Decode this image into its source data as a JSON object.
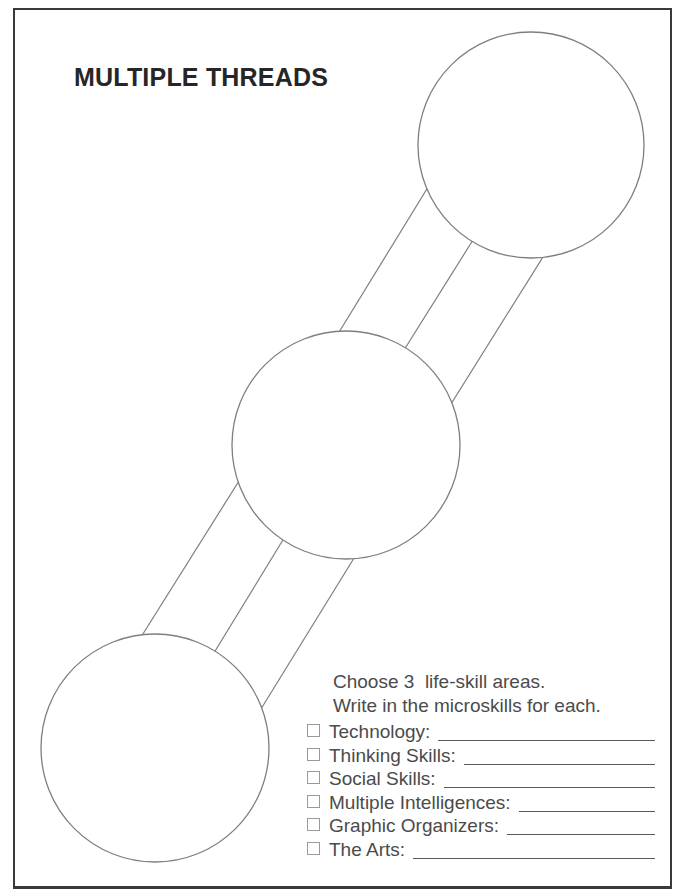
{
  "title": "MULTIPLE THREADS",
  "instructions": {
    "line1": "Choose 3  life-skill areas.",
    "line2": "Write in the microskills for each."
  },
  "checklist": [
    "Technology:",
    "Thinking Skills:",
    "Social Skills:",
    "Multiple Intelligences:",
    "Graphic Organizers:",
    "The Arts:"
  ],
  "diagram": {
    "circles": [
      {
        "id": "top-right",
        "cx": 531,
        "cy": 145,
        "r": 113
      },
      {
        "id": "middle",
        "cx": 346,
        "cy": 445,
        "r": 114
      },
      {
        "id": "bottom-left",
        "cx": 155,
        "cy": 748,
        "r": 114
      }
    ],
    "threads": [
      {
        "x1": 333,
        "y1": 342,
        "x2": 433,
        "y2": 179
      },
      {
        "x1": 399,
        "y1": 358,
        "x2": 478,
        "y2": 232
      },
      {
        "x1": 446,
        "y1": 412,
        "x2": 548,
        "y2": 249
      },
      {
        "x1": 244,
        "y1": 473,
        "x2": 136,
        "y2": 645
      },
      {
        "x1": 289,
        "y1": 530,
        "x2": 209,
        "y2": 661
      },
      {
        "x1": 359,
        "y1": 550,
        "x2": 256,
        "y2": 717
      }
    ]
  },
  "colors": {
    "background": "#ffffff",
    "ink": "#262626",
    "text": "#4b4b4b",
    "border": "#3a3a3a",
    "stroke": "#7e7e7e",
    "line": "#5a5a5a",
    "checkbox": "#9a9a9a"
  }
}
